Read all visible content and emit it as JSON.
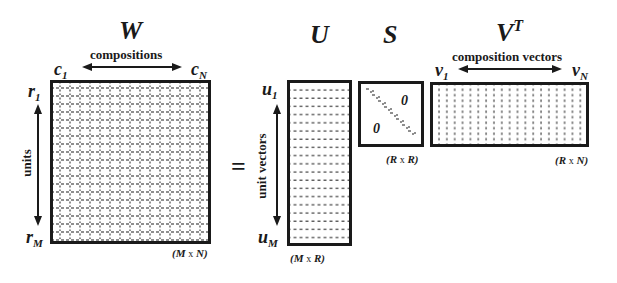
{
  "equation": "W = U S V^T",
  "equals_sign": "=",
  "matrices": {
    "W": {
      "title": "W",
      "axis_top_label": "compositions",
      "col_start": "c",
      "col_start_sub": "1",
      "col_end": "c",
      "col_end_sub": "N",
      "row_start": "r",
      "row_start_sub": "1",
      "row_end": "r",
      "row_end_sub": "M",
      "axis_side_label": "units",
      "dims": {
        "a": "(M",
        "x": "x",
        "b": "N)"
      }
    },
    "U": {
      "title": "U",
      "row_start": "u",
      "row_start_sub": "1",
      "row_end": "u",
      "row_end_sub": "M",
      "axis_side_label": "unit vectors",
      "dims": {
        "a": "(M",
        "x": "x",
        "b": "R)"
      }
    },
    "S": {
      "title": "S",
      "zero_upper": "0",
      "zero_lower": "0",
      "dims": {
        "a": "(R",
        "x": "x",
        "b": "R)"
      }
    },
    "VT": {
      "title": "V",
      "title_sup": "T",
      "axis_top_label": "composition vectors",
      "col_start": "v",
      "col_start_sub": "1",
      "col_end": "v",
      "col_end_sub": "N",
      "dims": {
        "a": "(R",
        "x": "x",
        "b": "N)"
      }
    }
  },
  "colors": {
    "ink": "#1a1a1a",
    "background": "#ffffff"
  }
}
